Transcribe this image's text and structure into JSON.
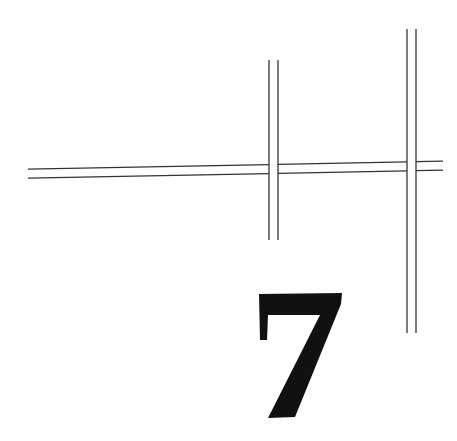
{
  "page": {
    "type": "chapter-opener",
    "chapter_number": "7"
  },
  "colors": {
    "background": "#ffffff",
    "ink": "#111111",
    "rule": "#333333"
  },
  "decoration": {
    "horizontal_rule": {
      "style": "double",
      "from_x": 28,
      "to_x": 443
    },
    "vertical_rules": [
      {
        "style": "double",
        "x": 273,
        "from_y": 60,
        "to_y": 240
      },
      {
        "style": "double",
        "x": 411,
        "from_y": 29,
        "to_y": 333
      }
    ]
  }
}
